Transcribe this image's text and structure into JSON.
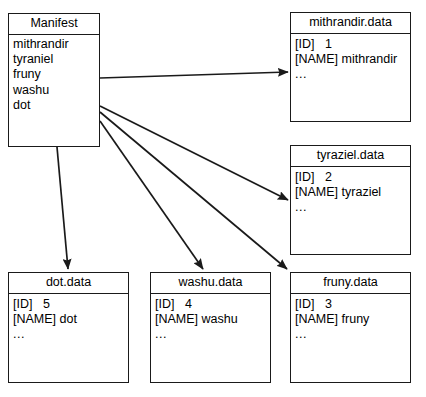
{
  "diagram": {
    "type": "node-link-diagram",
    "line_color": "#1a1a1a",
    "background_color": "#ffffff"
  },
  "nodes": {
    "manifest": {
      "title": "Manifest",
      "entries": [
        "mithrandir",
        "tyraniel",
        "fruny",
        "washu",
        "dot"
      ]
    },
    "mithrandir": {
      "title": "mithrandir.data",
      "id_label": "[ID]",
      "id_value": "1",
      "name_label": "[NAME]",
      "name_value": "mithrandir",
      "more": "..."
    },
    "tyraziel": {
      "title": "tyraziel.data",
      "id_label": "[ID]",
      "id_value": "2",
      "name_label": "[NAME]",
      "name_value": "tyraziel",
      "more": "..."
    },
    "fruny": {
      "title": "fruny.data",
      "id_label": "[ID]",
      "id_value": "3",
      "name_label": "[NAME]",
      "name_value": "fruny",
      "more": "..."
    },
    "washu": {
      "title": "washu.data",
      "id_label": "[ID]",
      "id_value": "4",
      "name_label": "[NAME]",
      "name_value": "washu",
      "more": "..."
    },
    "dot": {
      "title": "dot.data",
      "id_label": "[ID]",
      "id_value": "5",
      "name_label": "[NAME]",
      "name_value": "dot",
      "more": "..."
    }
  },
  "edges": [
    {
      "from": "manifest",
      "to": "mithrandir"
    },
    {
      "from": "manifest",
      "to": "tyraziel"
    },
    {
      "from": "manifest",
      "to": "fruny"
    },
    {
      "from": "manifest",
      "to": "washu"
    },
    {
      "from": "manifest",
      "to": "dot"
    }
  ]
}
